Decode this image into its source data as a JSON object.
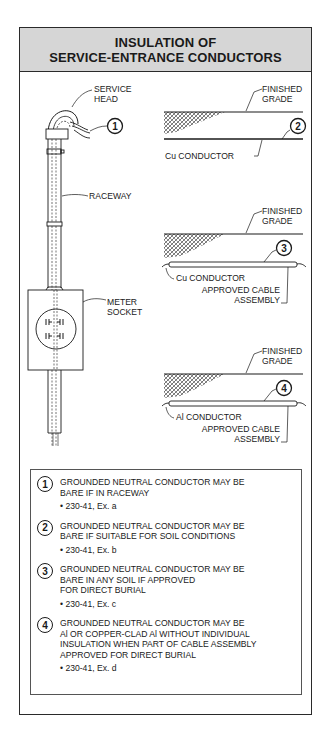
{
  "title": {
    "line1": "INSULATION OF",
    "line2": "SERVICE-ENTRANCE CONDUCTORS"
  },
  "left_diagram": {
    "service_head_label_1": "SERVICE",
    "service_head_label_2": "HEAD",
    "callout_number": "1",
    "raceway_label": "RACEWAY",
    "meter_socket_label_1": "METER",
    "meter_socket_label_2": "SOCKET"
  },
  "right_diagrams": [
    {
      "callout_number": "2",
      "grade_label_1": "FINISHED",
      "grade_label_2": "GRADE",
      "conductor_label": "Cu CONDUCTOR"
    },
    {
      "callout_number": "3",
      "grade_label_1": "FINISHED",
      "grade_label_2": "GRADE",
      "conductor_label": "Cu CONDUCTOR",
      "cable_label_1": "APPROVED CABLE",
      "cable_label_2": "ASSEMBLY"
    },
    {
      "callout_number": "4",
      "grade_label_1": "FINISHED",
      "grade_label_2": "GRADE",
      "conductor_label": "Al CONDUCTOR",
      "cable_label_1": "APPROVED CABLE",
      "cable_label_2": "ASSEMBLY"
    }
  ],
  "notes": [
    {
      "number": "1",
      "lines": [
        "GROUNDED NEUTRAL CONDUCTOR MAY BE",
        "BARE IF IN RACEWAY"
      ],
      "ref": "• 230-41, Ex. a"
    },
    {
      "number": "2",
      "lines": [
        "GROUNDED NEUTRAL CONDUCTOR MAY BE",
        "BARE IF SUITABLE FOR SOIL CONDITIONS"
      ],
      "ref": "• 230-41, Ex. b"
    },
    {
      "number": "3",
      "lines": [
        "GROUNDED NEUTRAL CONDUCTOR MAY BE",
        "BARE IN ANY SOIL IF APPROVED",
        "FOR DIRECT BURIAL"
      ],
      "ref": "• 230-41, Ex. c"
    },
    {
      "number": "4",
      "lines": [
        "GROUNDED NEUTRAL CONDUCTOR MAY BE",
        "Al OR COPPER-CLAD Al WITHOUT INDIVIDUAL",
        "INSULATION WHEN PART OF CABLE ASSEMBLY",
        "APPROVED FOR DIRECT BURIAL"
      ],
      "ref": "• 230-41, Ex. d"
    }
  ],
  "colors": {
    "header_bg": "#d6d6d6",
    "line": "#1a1a1a",
    "frame": "#2a2a2a"
  }
}
